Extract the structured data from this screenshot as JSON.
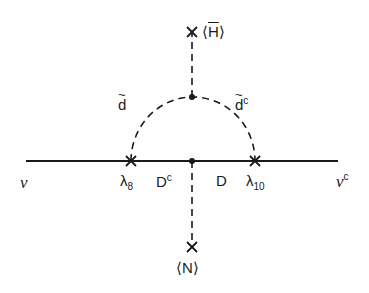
{
  "diagram": {
    "type": "feynman-diagram",
    "colors": {
      "line": "#1a1a1a",
      "background": "#ffffff"
    },
    "labels": {
      "vev_top": "⟨H̄⟩",
      "vev_top_symbol": "H",
      "vev_bottom": "⟨N⟩",
      "vev_bottom_symbol": "N",
      "squark_left": "d",
      "squark_right": "d",
      "squark_right_sup": "c",
      "fermion_left": "ν",
      "fermion_right": "ν",
      "fermion_right_sup": "c",
      "coupling_left": "λ",
      "coupling_left_sub": "8",
      "coupling_right": "λ",
      "coupling_right_sub": "10",
      "internal_left": "D",
      "internal_left_sup": "c",
      "internal_right": "D",
      "angle_open": "⟨",
      "angle_close": "⟩"
    }
  }
}
